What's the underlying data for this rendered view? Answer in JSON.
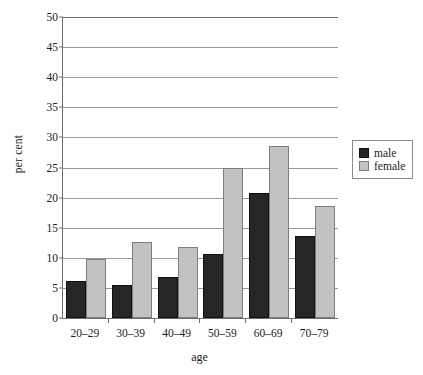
{
  "chart_data": {
    "type": "bar",
    "title": "",
    "xlabel": "age",
    "ylabel": "per cent",
    "categories": [
      "20–29",
      "30–39",
      "40–49",
      "50–59",
      "60–69",
      "70–79"
    ],
    "series": [
      {
        "name": "male",
        "color": "#262626",
        "values": [
          6.1,
          5.5,
          6.8,
          10.7,
          20.7,
          13.6
        ]
      },
      {
        "name": "female",
        "color": "#c2c2c2",
        "values": [
          9.8,
          12.7,
          11.8,
          24.9,
          28.5,
          18.6
        ]
      }
    ],
    "ylim": [
      0,
      50
    ],
    "ytick_step": 5,
    "yticks": [
      "0",
      "5",
      "10",
      "15",
      "20",
      "25",
      "30",
      "35",
      "40",
      "45",
      "50"
    ],
    "grid": true,
    "legend_position": "right",
    "legend_entries": [
      "male",
      "female"
    ]
  }
}
